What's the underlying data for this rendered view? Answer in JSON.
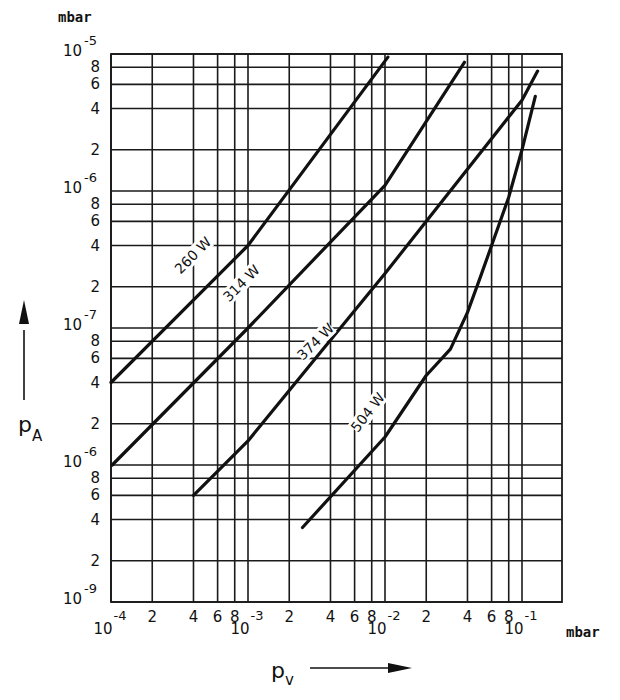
{
  "chart_data": {
    "type": "line",
    "title": "",
    "xlabel": "p_V",
    "ylabel": "p_A",
    "xunit": "mbar",
    "yunit": "mbar",
    "xscale": "log",
    "yscale": "log",
    "xlim": [
      0.0001,
      0.2
    ],
    "ylim": [
      1e-09,
      1e-05
    ],
    "grid": true,
    "x_ticks": [
      {
        "value": 0.0001,
        "label": "10",
        "exp": "-4"
      },
      {
        "value": 0.0002,
        "label": "2"
      },
      {
        "value": 0.0004,
        "label": "4"
      },
      {
        "value": 0.0006,
        "label": "6"
      },
      {
        "value": 0.0008,
        "label": "8"
      },
      {
        "value": 0.001,
        "label": "10",
        "exp": "-3"
      },
      {
        "value": 0.002,
        "label": "2"
      },
      {
        "value": 0.004,
        "label": "4"
      },
      {
        "value": 0.006,
        "label": "6"
      },
      {
        "value": 0.008,
        "label": "8"
      },
      {
        "value": 0.01,
        "label": "10",
        "exp": "-2"
      },
      {
        "value": 0.02,
        "label": "2"
      },
      {
        "value": 0.04,
        "label": "4"
      },
      {
        "value": 0.06,
        "label": "6"
      },
      {
        "value": 0.08,
        "label": "8"
      },
      {
        "value": 0.1,
        "label": "10",
        "exp": "-1"
      }
    ],
    "y_ticks": [
      {
        "value": 1e-05,
        "label": "10",
        "exp": "-5"
      },
      {
        "value": 8e-06,
        "label": "8"
      },
      {
        "value": 6e-06,
        "label": "6"
      },
      {
        "value": 4e-06,
        "label": "4"
      },
      {
        "value": 2e-06,
        "label": "2"
      },
      {
        "value": 1e-06,
        "label": "10",
        "exp": "-6"
      },
      {
        "value": 8e-07,
        "label": "8"
      },
      {
        "value": 6e-07,
        "label": "6"
      },
      {
        "value": 4e-07,
        "label": "4"
      },
      {
        "value": 2e-07,
        "label": "2"
      },
      {
        "value": 1e-07,
        "label": "10",
        "exp": "-7"
      },
      {
        "value": 8e-08,
        "label": "8"
      },
      {
        "value": 6e-08,
        "label": "6"
      },
      {
        "value": 4e-08,
        "label": "4"
      },
      {
        "value": 2e-08,
        "label": "2"
      },
      {
        "value": 1e-08,
        "label": "10",
        "exp": "-6"
      },
      {
        "value": 8e-09,
        "label": "8"
      },
      {
        "value": 6e-09,
        "label": "6"
      },
      {
        "value": 4e-09,
        "label": "4"
      },
      {
        "value": 2e-09,
        "label": "2"
      },
      {
        "value": 1e-09,
        "label": "10",
        "exp": "-9"
      }
    ],
    "series": [
      {
        "name": "260 W",
        "label_pos": {
          "x": 0.00042,
          "y": 3.2e-07,
          "angle": -45
        },
        "points": [
          [
            0.0001,
            4e-08
          ],
          [
            0.001,
            4e-07
          ],
          [
            0.0105,
            9.5e-06
          ]
        ]
      },
      {
        "name": "314 W",
        "label_pos": {
          "x": 0.00095,
          "y": 2e-07,
          "angle": -45
        },
        "points": [
          [
            0.000102,
            1e-08
          ],
          [
            0.001,
            1e-07
          ],
          [
            0.01,
            1.1e-06
          ],
          [
            0.038,
            8.7e-06
          ]
        ]
      },
      {
        "name": "374 W",
        "label_pos": {
          "x": 0.0033,
          "y": 7.5e-08,
          "angle": -45
        },
        "points": [
          [
            0.0004,
            6e-09
          ],
          [
            0.001,
            1.5e-08
          ],
          [
            0.01,
            2.5e-07
          ],
          [
            0.1,
            4.6e-06
          ],
          [
            0.13,
            7.5e-06
          ]
        ]
      },
      {
        "name": "504 W",
        "label_pos": {
          "x": 0.008,
          "y": 2.3e-08,
          "angle": -52
        },
        "points": [
          [
            0.0025,
            3.5e-09
          ],
          [
            0.01,
            1.6e-08
          ],
          [
            0.02,
            4.5e-08
          ],
          [
            0.03,
            7e-08
          ],
          [
            0.04,
            1.3e-07
          ],
          [
            0.05,
            2.4e-07
          ],
          [
            0.06,
            4e-07
          ],
          [
            0.08,
            9e-07
          ],
          [
            0.1,
            2e-06
          ],
          [
            0.125,
            4.9e-06
          ]
        ]
      }
    ]
  }
}
